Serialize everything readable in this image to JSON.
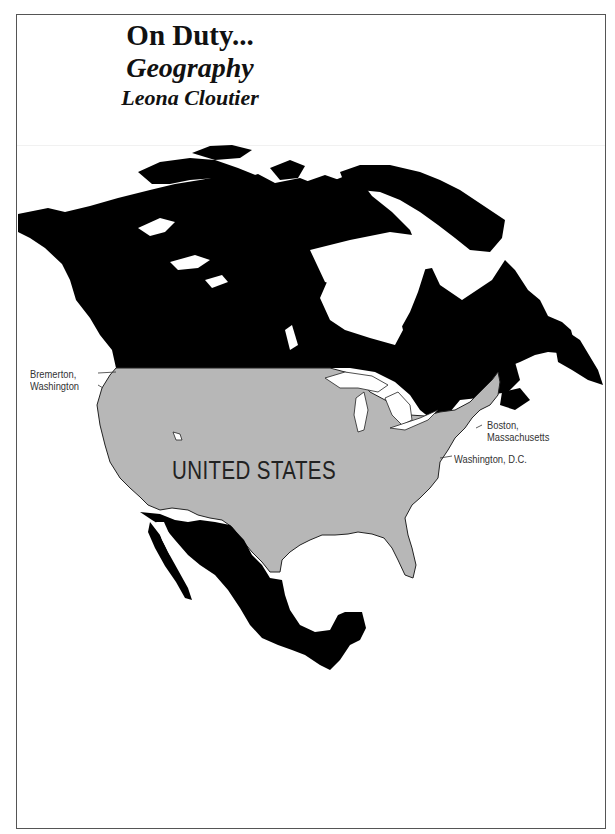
{
  "header": {
    "title": "On Duty...",
    "subtitle": "Geography",
    "author": "Leona Cloutier"
  },
  "map": {
    "region": "North America",
    "country_label": "UNITED STATES",
    "colors": {
      "united_states_fill": "#b7b7b7",
      "other_countries_fill": "#000000",
      "water": "#ffffff",
      "border": "#555555"
    },
    "locations": [
      {
        "line1": "Bremerton,",
        "line2": "Washington"
      },
      {
        "line1": "Boston,",
        "line2": "Massachusetts"
      },
      {
        "line1": "Washington, D.C.",
        "line2": ""
      }
    ]
  }
}
